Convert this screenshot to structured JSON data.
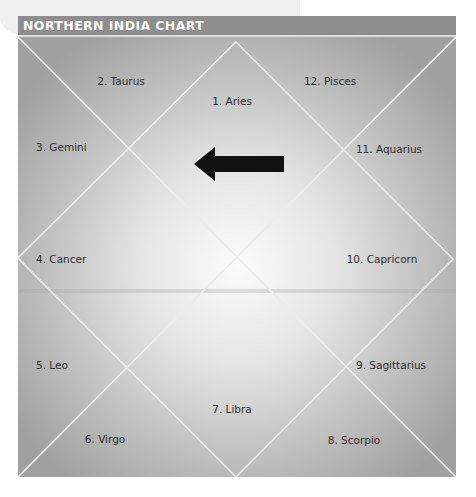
{
  "header": {
    "title": "NORTHERN INDIA CHART"
  },
  "chart": {
    "style": "North Indian diamond birth chart",
    "houses": [
      {
        "num": 1,
        "label": "1. Aries"
      },
      {
        "num": 2,
        "label": "2. Taurus"
      },
      {
        "num": 3,
        "label": "3. Gemini"
      },
      {
        "num": 4,
        "label": "4. Cancer"
      },
      {
        "num": 5,
        "label": "5. Leo"
      },
      {
        "num": 6,
        "label": "6. Virgo"
      },
      {
        "num": 7,
        "label": "7. Libra"
      },
      {
        "num": 8,
        "label": "8. Scorpio"
      },
      {
        "num": 9,
        "label": "9. Sagittarius"
      },
      {
        "num": 10,
        "label": "10. Capricorn"
      },
      {
        "num": 11,
        "label": "11. Aquarius"
      },
      {
        "num": 12,
        "label": "12. Pisces"
      }
    ],
    "arrow": {
      "direction": "left",
      "color": "#111111"
    },
    "colors": {
      "header_bg": "#8e8e8e",
      "line": "#e8e8e8",
      "center": "#fbfbfb",
      "edge": "#a0a0a0"
    }
  }
}
